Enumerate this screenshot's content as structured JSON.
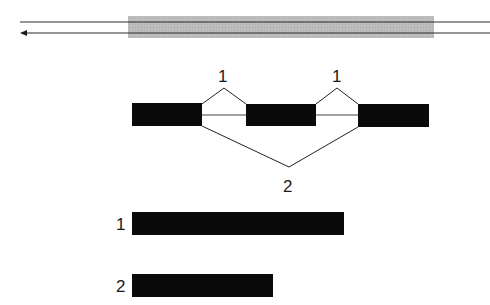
{
  "colors": {
    "exon": "#0a0a0a",
    "line": "#222222",
    "region_shade": "#b8b8b8"
  },
  "top_strands": {
    "description": "Double-stranded DNA with shaded gene region; lower strand with leftward arrow"
  },
  "splicing": {
    "exon_count": 3,
    "pattern_labels": [
      "1",
      "1",
      "2"
    ]
  },
  "products": [
    {
      "label": "1",
      "relative_length": 1.0
    },
    {
      "label": "2",
      "relative_length": 0.66
    }
  ]
}
